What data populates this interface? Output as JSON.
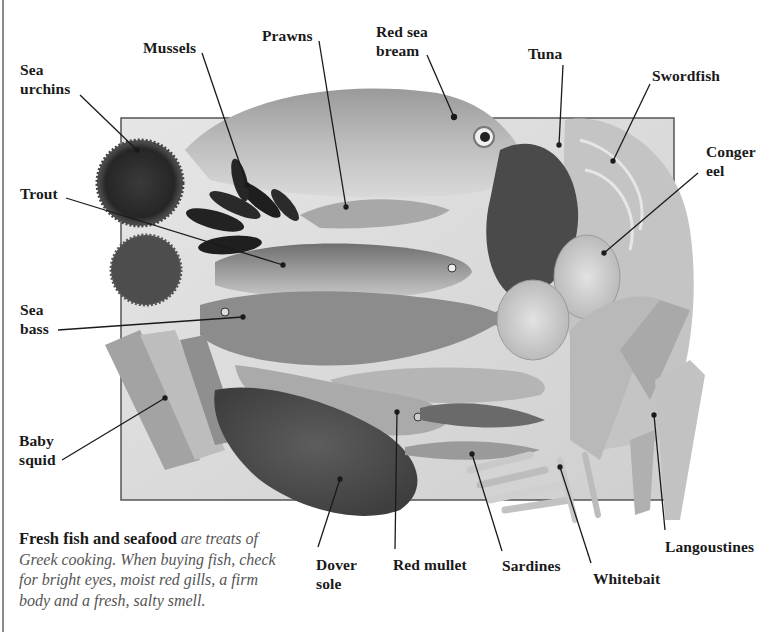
{
  "figure": {
    "type": "labeled-photograph",
    "colors": {
      "label_text": "#1a1a1a",
      "caption_text": "#555555",
      "leader_line": "#1a1a1a",
      "ice_box_border": "#555555",
      "page_edge": "#8a8a8a"
    }
  },
  "labels": [
    {
      "id": "sea-urchins",
      "line1": "Sea",
      "line2": "urchins"
    },
    {
      "id": "mussels",
      "line1": "Mussels",
      "line2": ""
    },
    {
      "id": "prawns",
      "line1": "Prawns",
      "line2": ""
    },
    {
      "id": "red-sea-bream",
      "line1": "Red sea",
      "line2": "bream"
    },
    {
      "id": "tuna",
      "line1": "Tuna",
      "line2": ""
    },
    {
      "id": "swordfish",
      "line1": "Swordfish",
      "line2": ""
    },
    {
      "id": "conger-eel",
      "line1": "Conger",
      "line2": "eel"
    },
    {
      "id": "trout",
      "line1": "Trout",
      "line2": ""
    },
    {
      "id": "sea-bass",
      "line1": "Sea",
      "line2": "bass"
    },
    {
      "id": "baby-squid",
      "line1": "Baby",
      "line2": "squid"
    },
    {
      "id": "dover-sole",
      "line1": "Dover",
      "line2": "sole"
    },
    {
      "id": "red-mullet",
      "line1": "Red mullet",
      "line2": ""
    },
    {
      "id": "sardines",
      "line1": "Sardines",
      "line2": ""
    },
    {
      "id": "whitebait",
      "line1": "Whitebait",
      "line2": ""
    },
    {
      "id": "langoustines",
      "line1": "Langoustines",
      "line2": ""
    }
  ],
  "caption": {
    "lead": "Fresh fish and seafood",
    "body": " are treats of Greek cooking. When buying fish, check for bright eyes, moist red gills, a firm body and a fresh, salty smell."
  }
}
